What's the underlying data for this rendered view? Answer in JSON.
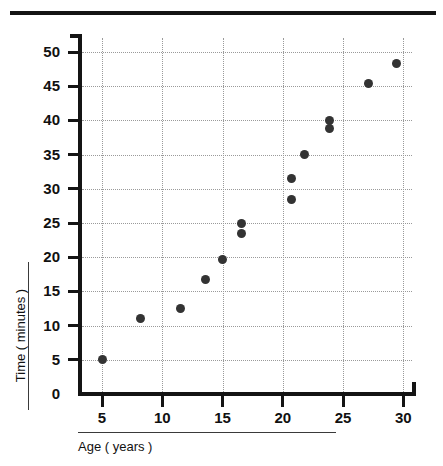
{
  "chart_data": {
    "type": "scatter",
    "title": "",
    "xlabel": "Age ( years )",
    "ylabel": "Time ( minutes )",
    "xlim": [
      3,
      32
    ],
    "ylim": [
      0,
      52
    ],
    "xticks": [
      5,
      10,
      15,
      20,
      25,
      30
    ],
    "yticks": [
      0,
      5,
      10,
      15,
      20,
      25,
      30,
      35,
      40,
      45,
      50
    ],
    "grid": true,
    "legend": false,
    "marker_color": "#333333",
    "points": [
      {
        "x": 5.0,
        "y": 5.0
      },
      {
        "x": 8.2,
        "y": 11.0
      },
      {
        "x": 11.5,
        "y": 12.5
      },
      {
        "x": 13.6,
        "y": 16.7
      },
      {
        "x": 15.0,
        "y": 19.7
      },
      {
        "x": 16.6,
        "y": 25.0
      },
      {
        "x": 16.6,
        "y": 23.5
      },
      {
        "x": 20.7,
        "y": 28.5
      },
      {
        "x": 20.7,
        "y": 31.5
      },
      {
        "x": 21.8,
        "y": 35.0
      },
      {
        "x": 23.9,
        "y": 40.0
      },
      {
        "x": 23.9,
        "y": 38.8
      },
      {
        "x": 27.1,
        "y": 45.4
      },
      {
        "x": 29.4,
        "y": 48.3
      }
    ]
  },
  "axes": {
    "x_tick_labels": [
      "5",
      "10",
      "15",
      "20",
      "25",
      "30"
    ],
    "y_tick_labels": [
      "0",
      "5",
      "10",
      "15",
      "20",
      "25",
      "30",
      "35",
      "40",
      "45",
      "50"
    ]
  },
  "titles": {
    "x_axis": "Age ( years )",
    "y_axis": "Time ( minutes )"
  }
}
